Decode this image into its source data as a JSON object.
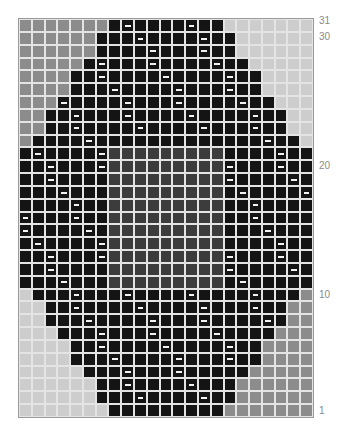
{
  "chart_data": {
    "type": "heatmap",
    "title": "",
    "columns": 23,
    "rows": 31,
    "legend": {
      "g": {
        "meaning": "medium grey stitch",
        "color": "#8c8c8c"
      },
      "l": {
        "meaning": "light grey stitch",
        "color": "#cdcdcd"
      },
      "b": {
        "meaning": "black stitch",
        "color": "#141414"
      },
      "d": {
        "meaning": "dark grey center stitch",
        "color": "#3c3c3c"
      },
      "x": {
        "meaning": "black stitch with white dash symbol",
        "color": "#141414"
      }
    },
    "row_labels": [
      {
        "row": 31,
        "label": "31"
      },
      {
        "row": 30,
        "label": "30"
      },
      {
        "row": 20,
        "label": "20"
      },
      {
        "row": 10,
        "label": "10"
      },
      {
        "row": 1,
        "label": "1"
      }
    ],
    "grid_rows_top_to_bottom": [
      {
        "row": 31,
        "cells": "gggggggbxbbbbxbblllllll"
      },
      {
        "row": 30,
        "cells": "ggggggbbbxbbbbxbbllllll"
      },
      {
        "row": 29,
        "cells": "ggggggbbbbxbbbxbbllllll"
      },
      {
        "row": 28,
        "cells": "gggggbxbbbxbbbbxbblllll"
      },
      {
        "row": 27,
        "cells": "ggggbbxbbbbxbbbbxbbllll"
      },
      {
        "row": 26,
        "cells": "ggggbbbxbbbbxbbbxbbllll"
      },
      {
        "row": 25,
        "cells": "gggxbbbbxbbbxbbbbxbblll"
      },
      {
        "row": 24,
        "cells": "ggbbxbbbxbbbbxbbbbxbbll"
      },
      {
        "row": 23,
        "cells": "ggbbxbbbbxbbbbxbbbxbbll"
      },
      {
        "row": 22,
        "cells": "gbbbbxbbbbbbbbbbbbbxbbl"
      },
      {
        "row": 21,
        "cells": "bxbbbbxdddddddddbbbbxbb"
      },
      {
        "row": 20,
        "cells": "bbxbbbxdddddddddxbbbxbb"
      },
      {
        "row": 19,
        "cells": "bbxbbbbdddddddddxbbbbxb"
      },
      {
        "row": 18,
        "cells": "bbbxbbbdddddddddbxbbbbx"
      },
      {
        "row": 17,
        "cells": "bbbbxbbdddddddddbbxbbbb"
      },
      {
        "row": 16,
        "cells": "xbbbxbbdddddddddbbxbbbb"
      },
      {
        "row": 15,
        "cells": "xbbbbxbdddddddddbbbxbbb"
      },
      {
        "row": 14,
        "cells": "bxbbbbxdddddddddbbbbxbb"
      },
      {
        "row": 13,
        "cells": "bbxbbbxdddddddddxbbbxbb"
      },
      {
        "row": 12,
        "cells": "bbxbbbbdddddddddxbbbbxb"
      },
      {
        "row": 11,
        "cells": "bbbxbbbdddddddddbxbbbbb"
      },
      {
        "row": 10,
        "cells": "lbbbxbbbxbbbbxbbbbxbbbg"
      },
      {
        "row": 9,
        "cells": "llbbxbbbbxbbbbxbbbxbbgg"
      },
      {
        "row": 8,
        "cells": "llbbbxbbbbxbbbxbbbbxbgg"
      },
      {
        "row": 7,
        "cells": "lllbbbxbbbxbbbbxbbbbggg"
      },
      {
        "row": 6,
        "cells": "llllbbxbbbbxbbbbxbbgggg"
      },
      {
        "row": 5,
        "cells": "llllbbbxbbbbxbbbxbbgggg"
      },
      {
        "row": 4,
        "cells": "lllllbbbxbbbxbbbbbggggg"
      },
      {
        "row": 3,
        "cells": "llllllbbxbbbbxbbbgggggg"
      },
      {
        "row": 2,
        "cells": "llllllbbbxbbbbxbbgggggg"
      },
      {
        "row": 1,
        "cells": "lllllllbbbbbbbbbggggggg"
      }
    ]
  }
}
